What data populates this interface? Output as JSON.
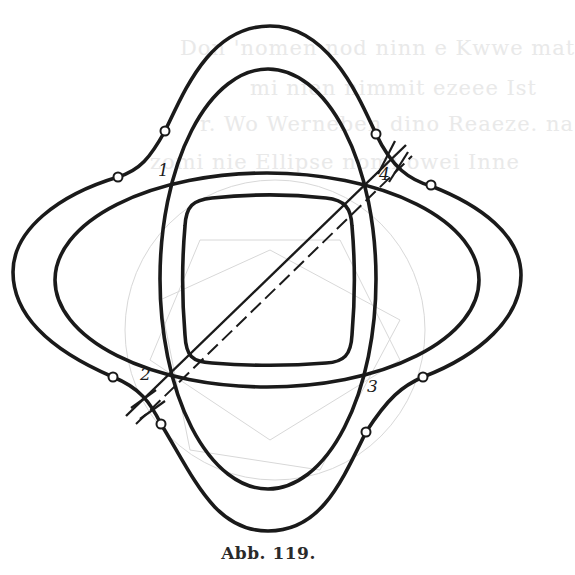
{
  "figure": {
    "caption": "Abb. 119.",
    "labels": [
      {
        "id": "1",
        "text": "1",
        "x": 158,
        "y": 160
      },
      {
        "id": "2",
        "text": "2",
        "x": 139,
        "y": 363
      },
      {
        "id": "3",
        "text": "3",
        "x": 366,
        "y": 378
      },
      {
        "id": "4",
        "text": "4",
        "x": 379,
        "y": 166
      }
    ],
    "intersection_points": [
      {
        "id": "1",
        "x": 172,
        "y": 185
      },
      {
        "id": "2",
        "x": 171,
        "y": 373
      },
      {
        "id": "3",
        "x": 364,
        "y": 373
      },
      {
        "id": "4",
        "x": 362,
        "y": 186
      }
    ],
    "marker_circles": [
      {
        "x": 118,
        "y": 177
      },
      {
        "x": 165,
        "y": 131
      },
      {
        "x": 376,
        "y": 134
      },
      {
        "x": 431,
        "y": 185
      },
      {
        "x": 113,
        "y": 377
      },
      {
        "x": 161,
        "y": 424
      },
      {
        "x": 423,
        "y": 377
      },
      {
        "x": 366,
        "y": 432
      }
    ],
    "shapes": {
      "vertical_ellipse": {
        "cx": 268,
        "cy": 279,
        "rx": 108,
        "ry": 210
      },
      "horizontal_ellipse": {
        "cx": 267,
        "cy": 280,
        "rx": 212,
        "ry": 107
      },
      "inner_rounded_square": {
        "left": 184,
        "top": 197,
        "right": 352,
        "bottom": 364
      },
      "diagonal_solid": {
        "from": [
          171,
          373
        ],
        "to": [
          362,
          186
        ]
      },
      "diagonal_dashed": {
        "from": [
          128,
          420
        ],
        "to": [
          405,
          150
        ]
      }
    },
    "bleed_through_text": [
      "Don 'nomen nod ninn e Kwwe mat",
      "mi nien nimmit ezeee Ist",
      "r. Wo Werneben dino Reaeze. na",
      "zomi nie Ellipse nomi owei Inne"
    ]
  }
}
